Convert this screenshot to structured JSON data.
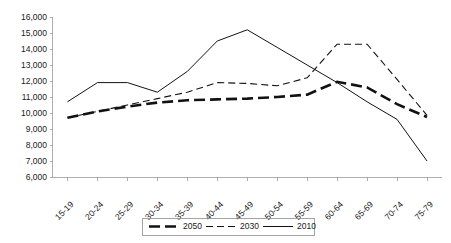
{
  "chart_data": {
    "type": "line",
    "title": "",
    "xlabel": "",
    "ylabel": "",
    "categories": [
      "15-19",
      "20-24",
      "25-29",
      "30-34",
      "35-39",
      "40-44",
      "45-49",
      "50-54",
      "55-59",
      "60-64",
      "65-69",
      "70-74",
      "75-79"
    ],
    "ylim": [
      6000,
      16000
    ],
    "ytick_step": 1000,
    "ytick_labels": [
      "16,000",
      "15,000",
      "14,000",
      "13,000",
      "12,000",
      "11,000",
      "10,000",
      "9,000",
      "8,000",
      "7,000",
      "6,000"
    ],
    "ytick_values": [
      16000,
      15000,
      14000,
      13000,
      12000,
      11000,
      10000,
      9000,
      8000,
      7000,
      6000
    ],
    "grid": false,
    "legend_position": "bottom",
    "series": [
      {
        "name": "2050",
        "style": "thick-dashed",
        "values": [
          9700,
          10100,
          10400,
          10650,
          10800,
          10850,
          10900,
          11000,
          11150,
          11950,
          11600,
          10550,
          9750
        ]
      },
      {
        "name": "2030",
        "style": "thin-dashed",
        "values": [
          9700,
          10100,
          10500,
          10900,
          11300,
          11900,
          11850,
          11700,
          12200,
          14300,
          14300,
          12100,
          9850
        ]
      },
      {
        "name": "2010",
        "style": "thin-solid",
        "values": [
          10700,
          11900,
          11900,
          11300,
          12600,
          14500,
          15200,
          14100,
          13000,
          11900,
          10700,
          9600,
          7000
        ]
      }
    ]
  },
  "legend": {
    "entries": [
      {
        "label": "2050"
      },
      {
        "label": "2030"
      },
      {
        "label": "2010"
      }
    ]
  }
}
